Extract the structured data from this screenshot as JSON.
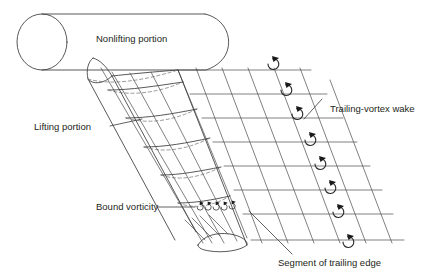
{
  "figure": {
    "background_color": "#ffffff",
    "line_color": "#3a3a3a",
    "text_color": "#231f20"
  },
  "labels": {
    "nonlifting_portion": "Nonlifting portion",
    "lifting_portion": "Lifting portion",
    "bound_vorticity": "Bound vorticity",
    "trailing_vortex_wake": "Trailing-vortex wake",
    "segment_of_trailing_edge": "Segment of trailing edge"
  },
  "diagram": {
    "body": {
      "name": "nonlifting-cylinder",
      "shape": "cylinder",
      "nose_ellipse": {
        "cx": 41,
        "cy": 42,
        "rx": 26,
        "ry": 28
      },
      "top_line": {
        "x1": 41,
        "y1": 14,
        "x2": 212,
        "y2": 14
      },
      "bottom_line": {
        "x1": 41,
        "y1": 70,
        "x2": 212,
        "y2": 70
      },
      "tail_arc": "curved right end"
    },
    "wing": {
      "name": "lifting-surface",
      "description": "swept tapered lifting portion with chordwise and spanwise grid, hidden lines dashed",
      "root_leading": {
        "x": 93,
        "y": 58
      },
      "tip_leading": {
        "x": 196,
        "y": 232
      },
      "chord_stations": 6,
      "span_stations": 5,
      "tip_airfoil": {
        "cx": 222,
        "cy": 243,
        "rx": 24,
        "ry": 7.5
      }
    },
    "wake": {
      "name": "trailing-vortex-wake",
      "description": "grid of streamwise horizontal lines crossed by swept trailing-edge segment lines, each cell carrying a circulation arrow",
      "horizontal_lines": 8,
      "slant_lines": 6,
      "vortex_symbols": 8,
      "vortex_symbol": "counterclockwise circulation arc with arrowhead"
    },
    "bound_vorticity_marks": {
      "name": "bound-vorticity-arrows",
      "count": 5,
      "description": "small circulation arrows distributed along the wing near the trailing edge"
    },
    "leaders": [
      {
        "label": "lifting_portion",
        "from": [
          112,
          128
        ],
        "to": [
          140,
          121
        ]
      },
      {
        "label": "bound_vorticity",
        "from": [
          160,
          206
        ],
        "to": [
          193,
          206
        ]
      },
      {
        "label": "trailing_vortex_wake",
        "from": [
          322,
          100
        ],
        "to": [
          306,
          118
        ]
      },
      {
        "label": "segment_of_trailing_edge",
        "from": [
          252,
          212
        ],
        "to": [
          293,
          254
        ]
      }
    ]
  }
}
